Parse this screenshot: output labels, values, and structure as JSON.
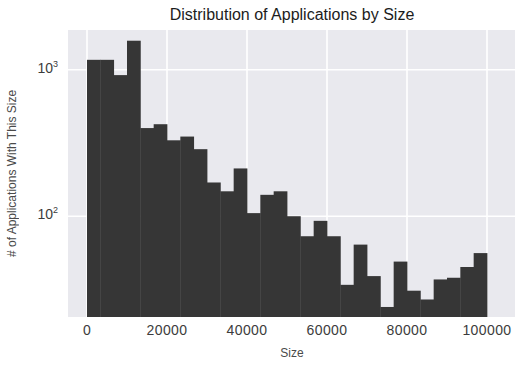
{
  "chart_data": {
    "type": "bar",
    "subtype": "histogram",
    "title": "Distribution of Applications by Size",
    "xlabel": "Size",
    "ylabel": "# of Applications With This Size",
    "yscale": "log",
    "grid": true,
    "legend": null,
    "bins": 30,
    "bin_range": [
      0,
      100000
    ],
    "bin_width": 3333.33,
    "values": [
      1170,
      1170,
      920,
      1580,
      400,
      425,
      330,
      350,
      287,
      170,
      148,
      212,
      105,
      140,
      148,
      100,
      73,
      93,
      73,
      34,
      64,
      39,
      24,
      49,
      31,
      27,
      37,
      38,
      45,
      56
    ],
    "x_ticks": [
      0,
      20000,
      40000,
      60000,
      80000,
      100000
    ],
    "y_ticks": [
      {
        "label_base": "10",
        "label_exp": "3",
        "value": 1000
      },
      {
        "label_base": "10",
        "label_exp": "2",
        "value": 100
      }
    ],
    "xlim": [
      -4750,
      107000
    ],
    "ylim": [
      20.5,
      1870
    ],
    "colors": {
      "bar": "#363636",
      "panel_bg": "#e9e9ee",
      "grid": "#ffffff",
      "title_text": "#1c1c1c",
      "tick_text": "#3c3c3c",
      "label_text": "#4a4a4a"
    }
  }
}
